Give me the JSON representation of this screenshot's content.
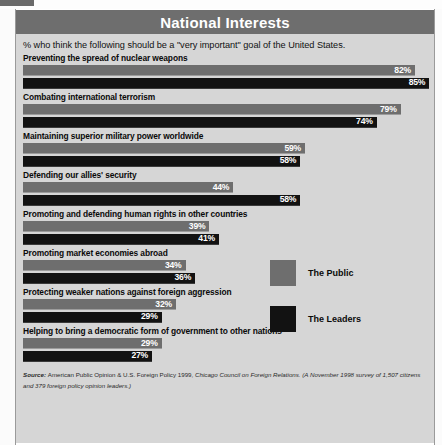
{
  "page": {
    "side_credit": "AP/Wide World"
  },
  "header": {
    "title": "National Interests",
    "subtitle": "% who think the following should be a \"very important\" goal of the United States."
  },
  "legend": {
    "items": [
      {
        "label": "The Public",
        "color": "#6e6e6e",
        "key": "public"
      },
      {
        "label": "The Leaders",
        "color": "#121212",
        "key": "leaders"
      }
    ]
  },
  "source": {
    "prefix": "Source:",
    "roman": "American Public Opinion & U.S. Foreign Policy 1999,",
    "italic_tail": "Chicago Council on Foreign Relations. (A November 1998 survey of 1,507 citizens and 379 foreign policy opinion leaders.)"
  },
  "chart_data": {
    "type": "bar",
    "orientation": "horizontal",
    "title": "National Interests",
    "subtitle": "% who think the following should be a \"very important\" goal of the United States.",
    "xlabel": "",
    "ylabel": "",
    "xlim": [
      0,
      100
    ],
    "grid": false,
    "legend_position": "right-middle",
    "value_suffix": "%",
    "categories": [
      "Preventing the spread of nuclear weapons",
      "Combating international terrorism",
      "Maintaining superior military power worldwide",
      "Defending our allies' security",
      "Promoting and defending human rights in other countries",
      "Promoting market economies abroad",
      "Protecting weaker nations against foreign aggression",
      "Helping to bring a democratic form of government to other nations"
    ],
    "series": [
      {
        "name": "The Public",
        "color": "#6e6e6e",
        "values": [
          82,
          79,
          59,
          44,
          39,
          34,
          32,
          29
        ],
        "labels": [
          "82%",
          "79%",
          "59%",
          "44%",
          "39%",
          "34%",
          "32%",
          "29%"
        ]
      },
      {
        "name": "The Leaders",
        "color": "#121212",
        "values": [
          85,
          74,
          58,
          58,
          41,
          36,
          29,
          27
        ],
        "labels": [
          "85%",
          "74%",
          "58%",
          "58%",
          "41%",
          "36%",
          "29%",
          "27%"
        ]
      }
    ]
  }
}
